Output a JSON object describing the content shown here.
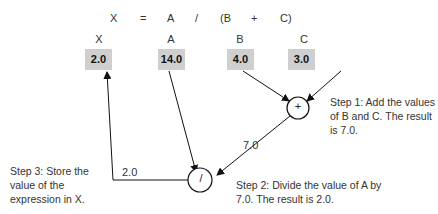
{
  "expression": {
    "tokens": [
      "X",
      "=",
      "A",
      "/",
      "(B",
      "+",
      "C)"
    ]
  },
  "variables": [
    {
      "name": "X",
      "value": "2.0"
    },
    {
      "name": "A",
      "value": "14.0"
    },
    {
      "name": "B",
      "value": "4.0"
    },
    {
      "name": "C",
      "value": "3.0"
    }
  ],
  "operators": {
    "add": "+",
    "divide": "/"
  },
  "edge_labels": {
    "sum_result": "7.0",
    "div_result": "2.0"
  },
  "steps": {
    "step1": {
      "line1": "Step 1:   Add the values",
      "line2": "of B and C. The result",
      "line3": "is 7.0."
    },
    "step2": {
      "line1": "Step 2:   Divide the value of A by",
      "line2": "7.0. The result is 2.0."
    },
    "step3": {
      "line1": "Step 3:   Store the",
      "line2": "value of the",
      "line3": "expression in X."
    }
  }
}
